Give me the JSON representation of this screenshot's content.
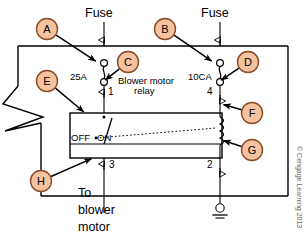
{
  "diagram": {
    "title_labels": {
      "fuse_left": "Fuse",
      "fuse_right": "Fuse",
      "relay_line1": "Blower motor",
      "relay_line2": "relay"
    },
    "ratings": {
      "fuse_left_rating": "25A",
      "fuse_right_rating": "10CA"
    },
    "terminals": {
      "t1": "1",
      "t2": "2",
      "t3": "3",
      "t4": "4"
    },
    "switch_positions": {
      "off": "OFF",
      "on": "ON"
    },
    "destination": {
      "line1": "To",
      "line2": "blower",
      "line3": "motor"
    },
    "callouts": [
      {
        "id": "A",
        "label": "A",
        "cx": 47,
        "cy": 29,
        "tip_x": 97,
        "tip_y": 62
      },
      {
        "id": "B",
        "label": "B",
        "cx": 165,
        "cy": 29,
        "tip_x": 213,
        "tip_y": 62
      },
      {
        "id": "C",
        "label": "C",
        "cx": 128,
        "cy": 62,
        "tip_x": 104,
        "tip_y": 81
      },
      {
        "id": "D",
        "label": "D",
        "cx": 248,
        "cy": 62,
        "tip_x": 220,
        "tip_y": 81
      },
      {
        "id": "E",
        "label": "E",
        "cx": 47,
        "cy": 81,
        "tip_x": 85,
        "tip_y": 113
      },
      {
        "id": "F",
        "label": "F",
        "cx": 252,
        "cy": 113,
        "tip_x": 222,
        "tip_y": 104
      },
      {
        "id": "G",
        "label": "G",
        "cx": 252,
        "cy": 150,
        "tip_x": 222,
        "tip_y": 140
      },
      {
        "id": "H",
        "label": "H",
        "cx": 41,
        "cy": 181,
        "tip_x": 93,
        "tip_y": 158
      }
    ],
    "credit": "© Cengage Learning 2013",
    "colors": {
      "callout_fill": "#f5c3a0",
      "callout_stroke": "#8a4a26",
      "wire": "#000000",
      "credit_text": "#6a6a6a"
    },
    "icons": {
      "fuse": "fuse-icon",
      "coil": "relay-coil-icon",
      "ground": "ground-icon",
      "break": "break-line-icon",
      "switch": "relay-switch-contact-icon"
    }
  }
}
